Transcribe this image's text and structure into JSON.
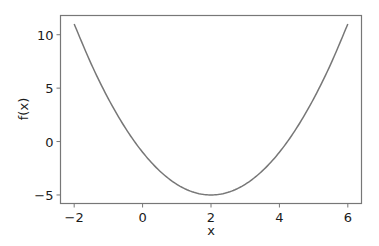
{
  "chart_data": {
    "type": "line",
    "title": "",
    "xlabel": "x",
    "ylabel": "f(x)",
    "xlim": [
      -2.4,
      6.4
    ],
    "ylim": [
      -5.8,
      11.8
    ],
    "grid": false,
    "legend": null,
    "x_ticks": [
      -2,
      0,
      2,
      4,
      6
    ],
    "x_tick_labels": [
      "−2",
      "0",
      "2",
      "4",
      "6"
    ],
    "y_ticks": [
      -5,
      0,
      5,
      10
    ],
    "y_tick_labels": [
      "−5",
      "0",
      "5",
      "10"
    ],
    "series": [
      {
        "name": "f(x) = (x-2)^2 - 5",
        "color": "#777777",
        "x": [
          -2,
          -1.5,
          -1,
          -0.5,
          0,
          0.5,
          1,
          1.5,
          2,
          2.5,
          3,
          3.5,
          4,
          4.5,
          5,
          5.5,
          6
        ],
        "y": [
          11,
          7.25,
          4,
          1.25,
          -1,
          -2.75,
          -4,
          -4.75,
          -5,
          -4.75,
          -4,
          -2.75,
          -1,
          1.25,
          4,
          7.25,
          11
        ]
      }
    ]
  }
}
